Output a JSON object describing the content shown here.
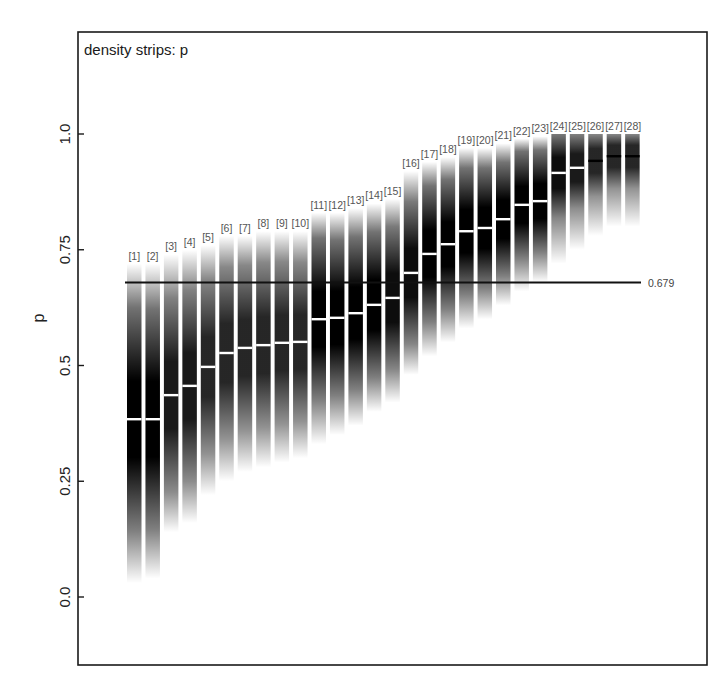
{
  "chart_data": {
    "type": "density-strip",
    "title": "density strips: p",
    "xlabel": "",
    "ylabel": "p",
    "ylim": [
      -0.15,
      1.15
    ],
    "yticks": [
      0.0,
      0.25,
      0.5,
      0.75,
      1.0
    ],
    "ytick_labels": [
      "0.0",
      "0.25",
      "0.5",
      "0.75",
      "1.0"
    ],
    "grid": false,
    "legend": null,
    "reference_line": {
      "value": 0.679,
      "label": "0.679"
    },
    "categories": [
      "[1]",
      "[2]",
      "[3]",
      "[4]",
      "[5]",
      "[6]",
      "[7]",
      "[8]",
      "[9]",
      "[10]",
      "[11]",
      "[12]",
      "[13]",
      "[14]",
      "[15]",
      "[16]",
      "[17]",
      "[18]",
      "[19]",
      "[20]",
      "[21]",
      "[22]",
      "[23]",
      "[24]",
      "[25]",
      "[26]",
      "[27]",
      "[28]"
    ],
    "series": [
      {
        "name": "median",
        "values": [
          0.384,
          0.384,
          0.436,
          0.456,
          0.497,
          0.527,
          0.538,
          0.544,
          0.549,
          0.551,
          0.6,
          0.603,
          0.613,
          0.631,
          0.646,
          0.7,
          0.741,
          0.762,
          0.79,
          0.797,
          0.816,
          0.847,
          0.855,
          0.916,
          0.927,
          0.942,
          0.952,
          0.952
        ]
      },
      {
        "name": "lower_extent",
        "values": [
          0.03,
          0.04,
          0.14,
          0.16,
          0.22,
          0.25,
          0.27,
          0.28,
          0.29,
          0.3,
          0.33,
          0.35,
          0.37,
          0.4,
          0.42,
          0.48,
          0.52,
          0.55,
          0.58,
          0.6,
          0.63,
          0.66,
          0.68,
          0.72,
          0.75,
          0.78,
          0.8,
          0.8
        ]
      },
      {
        "name": "upper_extent",
        "values": [
          0.72,
          0.72,
          0.74,
          0.75,
          0.76,
          0.78,
          0.78,
          0.79,
          0.79,
          0.79,
          0.83,
          0.83,
          0.84,
          0.85,
          0.86,
          0.92,
          0.94,
          0.95,
          0.97,
          0.97,
          0.98,
          0.99,
          0.995,
          1.0,
          1.0,
          1.0,
          1.0,
          1.0
        ]
      },
      {
        "name": "peak_darkness",
        "values": [
          1.0,
          1.0,
          0.9,
          0.9,
          0.85,
          0.85,
          0.85,
          0.85,
          0.85,
          0.85,
          1.0,
          1.0,
          1.0,
          1.0,
          0.95,
          0.95,
          1.0,
          1.0,
          1.0,
          1.0,
          1.0,
          1.0,
          1.0,
          0.95,
          0.9,
          0.85,
          0.85,
          0.85
        ]
      }
    ]
  },
  "colors": {
    "strip_dark": "#000000",
    "median_light": "#ffffff",
    "median_dark": "#000000",
    "frame": "#1a1a1a",
    "reference_line": "#111111",
    "label_gray": "#555555"
  }
}
